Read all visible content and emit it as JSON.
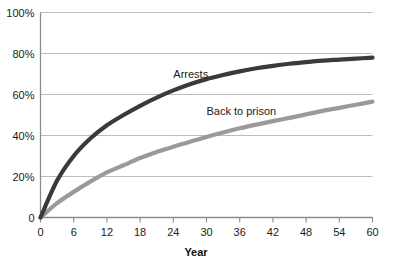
{
  "chart_data": {
    "type": "line",
    "title": "",
    "subtitle": "",
    "xlabel": "Year",
    "ylabel": "",
    "xlim": [
      0,
      60
    ],
    "ylim": [
      0,
      100
    ],
    "grid": "horizontal",
    "legend_position": "inline-labels",
    "x_tick_labels": [
      "0",
      "6",
      "12",
      "18",
      "24",
      "30",
      "36",
      "42",
      "48",
      "54",
      "60"
    ],
    "x_ticks": [
      0,
      6,
      12,
      18,
      24,
      30,
      36,
      42,
      48,
      54,
      60
    ],
    "y_tick_labels": [
      "0",
      "20%",
      "40%",
      "60%",
      "80%",
      "100%"
    ],
    "y_ticks": [
      0,
      20,
      40,
      60,
      80,
      100
    ],
    "x": [
      0,
      3,
      6,
      9,
      12,
      15,
      18,
      21,
      24,
      27,
      30,
      33,
      36,
      39,
      42,
      45,
      48,
      51,
      54,
      57,
      60
    ],
    "series": [
      {
        "name": "Arrests",
        "color": "#3a3a3a",
        "label_x": 24,
        "label_y": 68,
        "values": [
          0,
          18,
          30,
          38.5,
          45,
          50,
          54.5,
          58.5,
          62,
          65,
          67.5,
          69.5,
          71.3,
          72.8,
          74,
          75,
          75.8,
          76.5,
          77,
          77.5,
          78
        ]
      },
      {
        "name": "Back to prison",
        "color": "#9a9a9a",
        "label_x": 30,
        "label_y": 50,
        "values": [
          0,
          7,
          12.5,
          17.5,
          22,
          25.5,
          29,
          32,
          34.5,
          37,
          39.3,
          41.5,
          43.5,
          45.3,
          47,
          48.6,
          50.3,
          52,
          53.5,
          55,
          56.5
        ]
      }
    ]
  },
  "colors": {
    "arrests_line": "#3a3a3a",
    "back_to_prison_line": "#9a9a9a",
    "gridline": "#b4b4b4",
    "axis": "#8c8c8c",
    "text": "#1a1a1a",
    "background": "#ffffff"
  }
}
